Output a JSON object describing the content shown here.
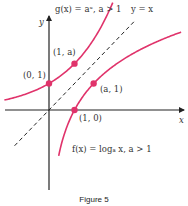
{
  "figure": {
    "caption": "Figure 5",
    "colors": {
      "curve": "#e0336b",
      "axis": "#222222",
      "dashed": "#222222",
      "text": "#333333"
    },
    "axes": {
      "x_label": "x",
      "y_label": "y"
    },
    "labels": {
      "exp_function": "g(x) = aˣ, a > 1",
      "log_function": "f(x) = logₐ x, a > 1",
      "identity_line": "y = x",
      "point_0_1": "(0, 1)",
      "point_1_a": "(1, a)",
      "point_1_0": "(1, 0)",
      "point_a_1": "(a, 1)"
    }
  },
  "chart_data": {
    "type": "line",
    "title": "",
    "xlabel": "x",
    "ylabel": "y",
    "a": 1.75,
    "xlim": [
      -1.7,
      5.1
    ],
    "ylim": [
      -3.1,
      3.5
    ],
    "grid": false,
    "series": [
      {
        "name": "g(x) = a^x, a > 1",
        "function": "exponential",
        "style": "solid"
      },
      {
        "name": "f(x) = log_a x, a > 1",
        "function": "logarithm",
        "style": "solid"
      },
      {
        "name": "y = x",
        "function": "identity",
        "style": "dashed"
      }
    ],
    "points": [
      {
        "label": "(0, 1)",
        "x": 0,
        "y": 1
      },
      {
        "label": "(1, a)",
        "x": 1,
        "y": 1.75
      },
      {
        "label": "(1, 0)",
        "x": 1,
        "y": 0
      },
      {
        "label": "(a, 1)",
        "x": 1.75,
        "y": 1
      }
    ]
  }
}
